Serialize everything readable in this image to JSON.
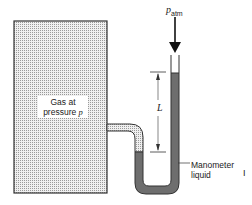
{
  "labels": {
    "tank": [
      "Gas at",
      "pressure"
    ],
    "tank_var": "p",
    "patm_main": "p",
    "patm_sub": "atm",
    "length": "L",
    "manometer": [
      "Manometer",
      "liquid"
    ],
    "edge_mark": "I"
  },
  "colors": {
    "gas_fill": "#d9d9d9",
    "liquid_fill": "#6e6e6e",
    "outline": "#333333"
  }
}
